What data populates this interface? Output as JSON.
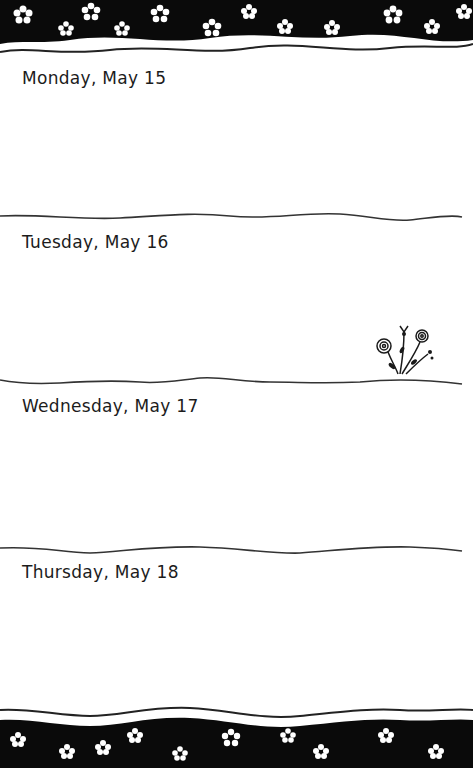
{
  "planner": {
    "days": [
      {
        "label": "Monday, May 15"
      },
      {
        "label": "Tuesday, May 16"
      },
      {
        "label": "Wednesday, May 17"
      },
      {
        "label": "Thursday, May 18"
      }
    ],
    "decor": {
      "top_band": "black-band-with-white-flowers",
      "bottom_band": "black-band-with-white-flowers",
      "doodle": "flower-doodle-icon"
    },
    "colors": {
      "band": "#0a0a0a",
      "flower": "#ffffff",
      "ink": "#1c1c1c",
      "paper": "#ffffff"
    }
  }
}
